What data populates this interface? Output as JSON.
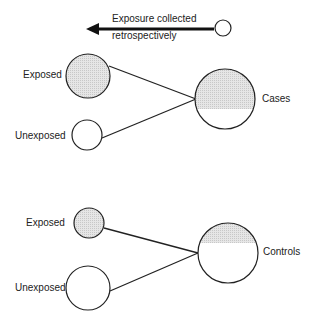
{
  "diagram": {
    "type": "case-control study design",
    "arrow_label_line1": "Exposure collected",
    "arrow_label_line2": "retrospectively",
    "groups": [
      {
        "name": "Cases",
        "exposed_label": "Exposed",
        "unexposed_label": "Unexposed",
        "shaded_fraction": "upper majority"
      },
      {
        "name": "Controls",
        "exposed_label": "Exposed",
        "unexposed_label": "Unexposed",
        "shaded_fraction": "upper minority"
      }
    ],
    "colors": {
      "stroke": "#222222",
      "shade": "#d9d9d9"
    }
  }
}
